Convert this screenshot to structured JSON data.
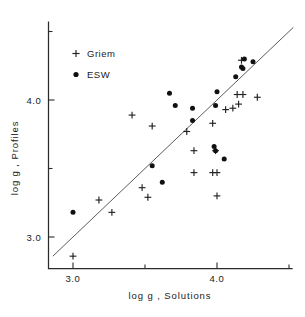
{
  "figure": {
    "background": "#ffffff",
    "ink_color": "#111111",
    "line_color": "#4a4a4a"
  },
  "axes": {
    "x_title": "log g , Solutions",
    "y_title": "log g , Profiles",
    "x_ticks": [
      {
        "value": 3.0,
        "label": "3.0",
        "major": true
      },
      {
        "value": 3.5,
        "label": "",
        "major": false
      },
      {
        "value": 4.0,
        "label": "4.0",
        "major": true
      },
      {
        "value": 4.5,
        "label": "",
        "major": false
      }
    ],
    "y_ticks": [
      {
        "value": 3.0,
        "label": "3.0",
        "major": true
      },
      {
        "value": 3.5,
        "label": "",
        "major": false
      },
      {
        "value": 4.0,
        "label": "4.0",
        "major": true
      },
      {
        "value": 4.5,
        "label": "",
        "major": false
      }
    ]
  },
  "legend": {
    "position": "top-left",
    "entries": [
      {
        "marker": "plus-marker",
        "label": "Griem"
      },
      {
        "marker": "dot-marker",
        "label": "ESW"
      }
    ]
  },
  "chart_data": {
    "type": "scatter",
    "title": "",
    "xlabel": "log g , Solutions",
    "ylabel": "log g , Profiles",
    "xlim": [
      2.83,
      4.6
    ],
    "ylim": [
      2.77,
      4.58
    ],
    "grid": false,
    "legend_position": "top-left",
    "reference_line": {
      "name": "one-to-one-line",
      "kind": "identity",
      "slope": 1.0,
      "intercept": 0.0,
      "x_start": 2.86,
      "x_end": 4.53
    },
    "series": [
      {
        "name": "Griem",
        "marker": "plus",
        "color": "#222222",
        "points": [
          [
            3.0,
            2.86
          ],
          [
            3.18,
            3.27
          ],
          [
            3.27,
            3.18
          ],
          [
            3.41,
            3.89
          ],
          [
            3.48,
            3.36
          ],
          [
            3.52,
            3.29
          ],
          [
            3.55,
            3.81
          ],
          [
            3.79,
            3.77
          ],
          [
            3.84,
            3.63
          ],
          [
            3.84,
            3.47
          ],
          [
            3.97,
            3.47
          ],
          [
            4.0,
            3.47
          ],
          [
            3.97,
            3.83
          ],
          [
            3.99,
            3.63
          ],
          [
            4.0,
            3.3
          ],
          [
            4.06,
            3.93
          ],
          [
            4.11,
            3.94
          ],
          [
            4.14,
            4.04
          ],
          [
            4.18,
            4.04
          ],
          [
            4.15,
            3.97
          ],
          [
            4.17,
            4.29
          ],
          [
            4.28,
            4.02
          ]
        ]
      },
      {
        "name": "ESW",
        "marker": "dot",
        "color": "#111111",
        "points": [
          [
            3.0,
            3.18
          ],
          [
            3.55,
            3.52
          ],
          [
            3.62,
            3.4
          ],
          [
            3.67,
            4.05
          ],
          [
            3.71,
            3.96
          ],
          [
            3.83,
            3.94
          ],
          [
            3.83,
            3.85
          ],
          [
            3.99,
            3.96
          ],
          [
            4.0,
            4.06
          ],
          [
            3.98,
            3.66
          ],
          [
            3.99,
            3.63
          ],
          [
            4.05,
            3.57
          ],
          [
            4.13,
            4.17
          ],
          [
            4.17,
            4.24
          ],
          [
            4.18,
            4.23
          ],
          [
            4.19,
            4.3
          ],
          [
            4.25,
            4.28
          ]
        ]
      }
    ]
  }
}
